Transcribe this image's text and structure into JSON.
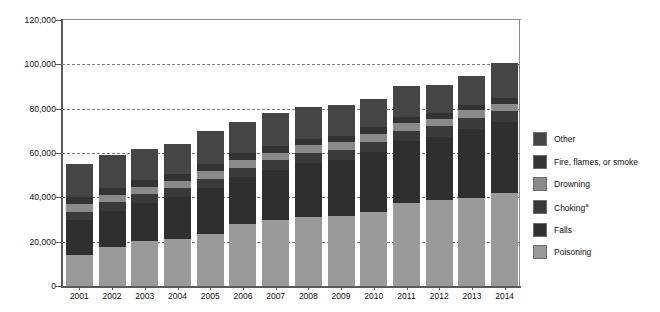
{
  "chart_data": {
    "type": "bar",
    "stacked": true,
    "title": "",
    "xlabel": "",
    "ylabel": "Number of deaths",
    "ylim": [
      0,
      120000
    ],
    "ytick_step": 20000,
    "ytick_labels": [
      "0",
      "20,000",
      "40,000",
      "60,000",
      "80,000",
      "100,000",
      "120,000"
    ],
    "ytick_values": [
      0,
      20000,
      40000,
      60000,
      80000,
      100000,
      120000
    ],
    "grid": "horizontal-dashed",
    "legend_position": "right",
    "categories": [
      "2001",
      "2002",
      "2003",
      "2004",
      "2005",
      "2006",
      "2007",
      "2008",
      "2009",
      "2010",
      "2011",
      "2012",
      "2013",
      "2014"
    ],
    "stack_order_bottom_to_top": [
      "Poisoning",
      "Falls",
      "Choking",
      "Drowning",
      "Fire, flames, or smoke",
      "Other"
    ],
    "series": [
      {
        "name": "Poisoning",
        "color": "#9a9a9a",
        "values": [
          14200,
          17500,
          20100,
          21000,
          23600,
          28000,
          29800,
          31200,
          31800,
          33500,
          37500,
          38900,
          39900,
          42000
        ]
      },
      {
        "name": "Falls",
        "color": "#2f2f2f",
        "values": [
          15500,
          16300,
          17300,
          19000,
          20400,
          21000,
          22400,
          24200,
          25000,
          26800,
          27800,
          28200,
          30900,
          31800
        ]
      },
      {
        "name": "Choking",
        "color": "#3a3a3a",
        "values": [
          3900,
          4000,
          4100,
          4200,
          4300,
          4400,
          4500,
          4500,
          4600,
          4700,
          4800,
          4900,
          5000,
          5100
        ]
      },
      {
        "name": "Drowning",
        "color": "#8a8a8a",
        "values": [
          3300,
          3400,
          3300,
          3300,
          3600,
          3600,
          3500,
          3600,
          3500,
          3800,
          3600,
          3400,
          3400,
          3400
        ]
      },
      {
        "name": "Fire, flames, or smoke",
        "color": "#333333",
        "values": [
          3300,
          3200,
          3200,
          3100,
          3200,
          3100,
          3000,
          2900,
          2800,
          2800,
          2700,
          2600,
          2600,
          2700
        ]
      },
      {
        "name": "Other",
        "color": "#454545",
        "values": [
          14800,
          14600,
          13600,
          13400,
          15000,
          14000,
          15000,
          14200,
          14000,
          12600,
          13700,
          12800,
          12800,
          15400
        ]
      }
    ],
    "totals": [
      55000,
      59000,
      61600,
      64000,
      70100,
      74100,
      78200,
      80600,
      81700,
      84200,
      90100,
      90800,
      94600,
      100400
    ],
    "annotations": {
      "choking_footnote_marker": "a"
    }
  },
  "legend": {
    "items": [
      {
        "label": "Other",
        "color": "#454545"
      },
      {
        "label": "Fire, flames, or smoke",
        "color": "#333333"
      },
      {
        "label": "Drowning",
        "color": "#8a8a8a"
      },
      {
        "label": "Choking",
        "superscript": "a",
        "color": "#3a3a3a"
      },
      {
        "label": "Falls",
        "color": "#2f2f2f"
      },
      {
        "label": "Poisoning",
        "color": "#9a9a9a"
      }
    ]
  },
  "axis": {
    "y_title": "Number of deaths"
  }
}
